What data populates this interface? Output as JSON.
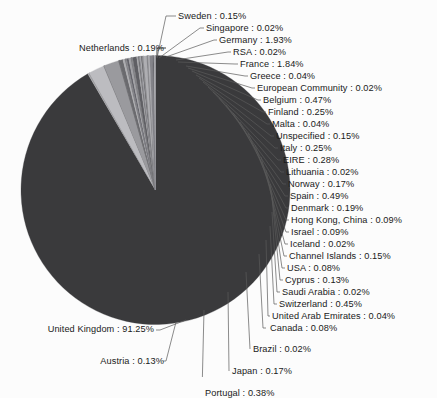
{
  "chart_data": {
    "type": "pie",
    "title": "",
    "subtitle": "",
    "xlabel": "",
    "ylabel": "",
    "legend_position": "none",
    "grid": false,
    "value_unit": "%",
    "categories": [
      "United Kingdom",
      "Germany",
      "France",
      "Belgium",
      "Spain",
      "Switzerland",
      "Portugal",
      "EIRE",
      "Finland",
      "Italy",
      "Denmark",
      "Netherlands",
      "Norway",
      "Japan",
      "Sweden",
      "Unspecified",
      "Channel Islands",
      "Austria",
      "Cyprus",
      "Hong Kong, China",
      "Israel",
      "USA",
      "Canada",
      "Greece",
      "Malta",
      "United Arab Emirates",
      "Singapore",
      "RSA",
      "European Community",
      "Lithuania",
      "Iceland",
      "Saudi Arabia",
      "Brazil"
    ],
    "values": [
      91.25,
      1.93,
      1.84,
      0.47,
      0.49,
      0.45,
      0.38,
      0.28,
      0.25,
      0.25,
      0.19,
      0.19,
      0.17,
      0.17,
      0.15,
      0.15,
      0.15,
      0.13,
      0.13,
      0.09,
      0.09,
      0.08,
      0.08,
      0.04,
      0.04,
      0.04,
      0.02,
      0.02,
      0.02,
      0.02,
      0.02,
      0.02,
      0.02
    ]
  },
  "slices": [
    {
      "name": "United Kingdom",
      "value": "91.25",
      "label": "United Kingdom : 91.25%",
      "color": "#3a3a3c"
    },
    {
      "name": "Sweden",
      "value": "0.15",
      "label": "Sweden : 0.15%",
      "color": "#a9a9ac"
    },
    {
      "name": "Singapore",
      "value": "0.02",
      "label": "Singapore : 0.02%",
      "color": "#6e6e72"
    },
    {
      "name": "Germany",
      "value": "1.93",
      "label": "Germany : 1.93%",
      "color": "#bcbcc0"
    },
    {
      "name": "RSA",
      "value": "0.02",
      "label": "RSA : 0.02%",
      "color": "#5c5c60"
    },
    {
      "name": "France",
      "value": "1.84",
      "label": "France : 1.84%",
      "color": "#9a9a9e"
    },
    {
      "name": "Greece",
      "value": "0.04",
      "label": "Greece : 0.04%",
      "color": "#4a4a4e"
    },
    {
      "name": "European Community",
      "value": "0.02",
      "label": "European Community : 0.02%",
      "color": "#8a8a8e"
    },
    {
      "name": "Belgium",
      "value": "0.47",
      "label": "Belgium : 0.47%",
      "color": "#6a6a6e"
    },
    {
      "name": "Finland",
      "value": "0.25",
      "label": "Finland : 0.25%",
      "color": "#acacb0"
    },
    {
      "name": "Malta",
      "value": "0.04",
      "label": "Malta : 0.04%",
      "color": "#555559"
    },
    {
      "name": "Unspecified",
      "value": "0.15",
      "label": "Unspecified : 0.15%",
      "color": "#909094"
    },
    {
      "name": "Italy",
      "value": "0.25",
      "label": "Italy : 0.25%",
      "color": "#63636a"
    },
    {
      "name": "EIRE",
      "value": "0.28",
      "label": "EIRE : 0.28%",
      "color": "#a0a0a4"
    },
    {
      "name": "Lithuania",
      "value": "0.02",
      "label": "Lithuania : 0.02%",
      "color": "#4e4e52"
    },
    {
      "name": "Norway",
      "value": "0.17",
      "label": "Norway : 0.17%",
      "color": "#8c8c90"
    },
    {
      "name": "Spain",
      "value": "0.49",
      "label": "Spain : 0.49%",
      "color": "#5f5f64"
    },
    {
      "name": "Denmark",
      "value": "0.19",
      "label": "Denmark : 0.19%",
      "color": "#a4a4a8"
    },
    {
      "name": "Hong Kong, China",
      "value": "0.09",
      "label": "Hong Kong, China : 0.09%",
      "color": "#57575b"
    },
    {
      "name": "Israel",
      "value": "0.09",
      "label": "Israel : 0.09%",
      "color": "#96969a"
    },
    {
      "name": "Iceland",
      "value": "0.02",
      "label": "Iceland : 0.02%",
      "color": "#6b6b70"
    },
    {
      "name": "Channel Islands",
      "value": "0.15",
      "label": "Channel Islands : 0.15%",
      "color": "#b2b2b6"
    },
    {
      "name": "USA",
      "value": "0.08",
      "label": "USA : 0.08%",
      "color": "#515155"
    },
    {
      "name": "Cyprus",
      "value": "0.13",
      "label": "Cyprus : 0.13%",
      "color": "#8e8e92"
    },
    {
      "name": "Saudi Arabia",
      "value": "0.02",
      "label": "Saudi Arabia : 0.02%",
      "color": "#66666b"
    },
    {
      "name": "Switzerland",
      "value": "0.45",
      "label": "Switzerland : 0.45%",
      "color": "#aeaeb2"
    },
    {
      "name": "United Arab Emirates",
      "value": "0.04",
      "label": "United Arab Emirates : 0.04%",
      "color": "#5a5a5e"
    },
    {
      "name": "Canada",
      "value": "0.08",
      "label": "Canada : 0.08%",
      "color": "#9c9ca0"
    },
    {
      "name": "Brazil",
      "value": "0.02",
      "label": "Brazil : 0.02%",
      "color": "#707074"
    },
    {
      "name": "Japan",
      "value": "0.17",
      "label": "Japan : 0.17%",
      "color": "#b6b6ba"
    },
    {
      "name": "Portugal",
      "value": "0.38",
      "label": "Portugal : 0.38%",
      "color": "#84848a"
    },
    {
      "name": "Austria",
      "value": "0.13",
      "label": "Austria : 0.13%",
      "color": "#5d5d62"
    },
    {
      "name": "Netherlands",
      "value": "0.19",
      "label": "Netherlands : 0.19%",
      "color": "#a8a8ac"
    }
  ],
  "labels": {
    "sweden": "Sweden : 0.15%",
    "singapore": "Singapore : 0.02%",
    "germany": "Germany : 1.93%",
    "rsa": "RSA : 0.02%",
    "france": "France : 1.84%",
    "greece": "Greece : 0.04%",
    "european_community": "European Community : 0.02%",
    "belgium": "Belgium : 0.47%",
    "finland": "Finland : 0.25%",
    "malta": "Malta : 0.04%",
    "unspecified": "Unspecified : 0.15%",
    "italy": "Italy : 0.25%",
    "eire": "EIRE : 0.28%",
    "lithuania": "Lithuania : 0.02%",
    "norway": "Norway : 0.17%",
    "spain": "Spain : 0.49%",
    "denmark": "Denmark : 0.19%",
    "hong_kong": "Hong Kong, China : 0.09%",
    "israel": "Israel : 0.09%",
    "iceland": "Iceland : 0.02%",
    "channel_islands": "Channel Islands : 0.15%",
    "usa": "USA : 0.08%",
    "cyprus": "Cyprus : 0.13%",
    "saudi_arabia": "Saudi Arabia : 0.02%",
    "switzerland": "Switzerland : 0.45%",
    "uae": "United Arab Emirates : 0.04%",
    "canada": "Canada : 0.08%",
    "brazil": "Brazil : 0.02%",
    "japan": "Japan : 0.17%",
    "portugal": "Portugal : 0.38%",
    "austria": "Austria : 0.13%",
    "netherlands": "Netherlands : 0.19%",
    "united_kingdom": "United Kingdom : 91.25%"
  },
  "colors": {
    "background": "#fcfcfc",
    "major_slice": "#3a3a3c",
    "text": "#1a1a1a",
    "leader_line": "#5a5a5a"
  }
}
